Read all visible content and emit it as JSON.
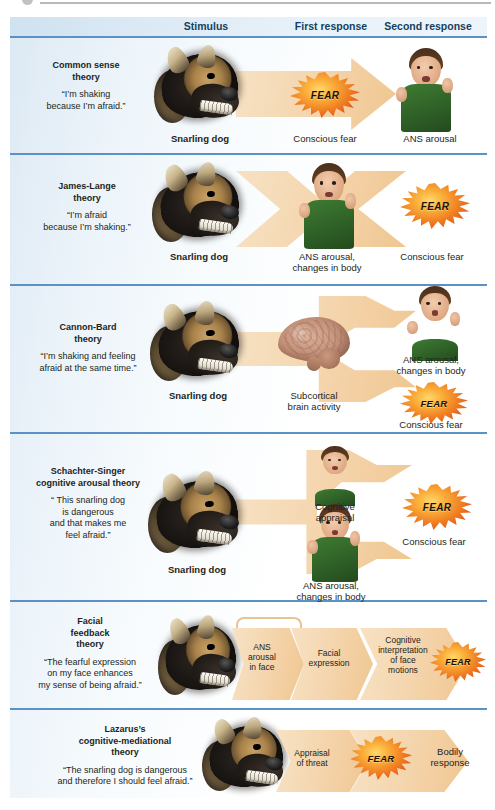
{
  "figure": {
    "header": {
      "columns": [
        "Stimulus",
        "First response",
        "Second response"
      ]
    },
    "colors": {
      "header_band": "#dceaf5",
      "rule": "#5b91c4",
      "arrow": "#f3cfa2",
      "fear_burst": "#f07f22",
      "shirt_green": "#2f6127",
      "panel_tint": "#eaf2f9"
    },
    "rows": [
      {
        "id": "common-sense",
        "title": "Common sense\ntheory",
        "quote": "“I’m shaking\nbecause I’m afraid.”",
        "stimulus_caption": "Snarling dog",
        "first_caption": "Conscious fear",
        "second_caption": "ANS arousal",
        "burst_label": "FEAR",
        "images": [
          "snarling-dog",
          "fearful-boy"
        ]
      },
      {
        "id": "james-lange",
        "title": "James-Lange\ntheory",
        "quote": "“I’m afraid\nbecause I’m shaking.”",
        "stimulus_caption": "Snarling dog",
        "first_caption": "ANS arousal,\nchanges in body",
        "second_caption": "Conscious fear",
        "burst_label": "FEAR",
        "images": [
          "snarling-dog",
          "fearful-boy"
        ]
      },
      {
        "id": "cannon-bard",
        "title": "Cannon-Bard\ntheory",
        "quote": "“I’m shaking and feeling\nafraid at the same time.”",
        "stimulus_caption": "Snarling dog",
        "first_caption": "Subcortical\nbrain activity",
        "second_caption_top": "ANS arousal,\nchanges in body",
        "second_caption_bottom": "Conscious fear",
        "burst_label": "FEAR",
        "images": [
          "snarling-dog",
          "brain",
          "fearful-boy"
        ]
      },
      {
        "id": "schachter-singer",
        "title": "Schachter-Singer\ncognitive arousal theory",
        "quote": "“ This snarling dog\nis dangerous\nand that makes me\nfeel afraid.”",
        "stimulus_caption": "Snarling dog",
        "first_caption_top": "Cognitive\nappraisal",
        "first_caption_bottom": "ANS arousal,\nchanges in body",
        "second_caption": "Conscious fear",
        "burst_label": "FEAR",
        "images": [
          "snarling-dog",
          "boy-head",
          "fearful-boy"
        ]
      },
      {
        "id": "facial-feedback",
        "title": "Facial\nfeedback\ntheory",
        "quote": "“The fearful expression\non my face enhances\nmy sense of being afraid.”",
        "stages": [
          "ANS\narousal\nin face",
          "Facial\nexpression",
          "Cognitive\ninterpretation\nof face\nmotions"
        ],
        "burst_label": "FEAR",
        "images": [
          "snarling-dog"
        ]
      },
      {
        "id": "lazarus",
        "title": "Lazarus’s\ncognitive-mediational\ntheory",
        "quote": "“The snarling dog is dangerous\nand therefore I should feel afraid.”",
        "stages": [
          "Appraisal\nof threat"
        ],
        "burst_label": "FEAR",
        "end_caption": "Bodily\nresponse",
        "images": [
          "snarling-dog"
        ]
      }
    ]
  }
}
